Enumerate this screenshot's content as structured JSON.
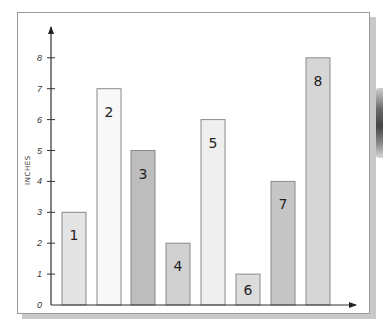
{
  "chart_data": {
    "type": "bar",
    "title": "",
    "xlabel": "",
    "ylabel": "INCHES",
    "categories": [
      "1",
      "2",
      "3",
      "4",
      "5",
      "6",
      "7",
      "8"
    ],
    "values": [
      3,
      7,
      5,
      2,
      6,
      1,
      4,
      8
    ],
    "bar_labels": [
      "1",
      "2",
      "3",
      "4",
      "5",
      "6",
      "7",
      "8"
    ],
    "bar_colors": [
      "#e4e4e4",
      "#f8f8f8",
      "#bdbdbd",
      "#d0d0d0",
      "#efefef",
      "#dcdcdc",
      "#c6c6c6",
      "#d6d6d6"
    ],
    "yticks": [
      "0",
      "1",
      "2",
      "3",
      "4",
      "5",
      "6",
      "7",
      "8"
    ],
    "ylim": [
      0,
      8
    ],
    "grid": false,
    "legend": "none"
  },
  "axis": {
    "y_title": "INCHES"
  }
}
